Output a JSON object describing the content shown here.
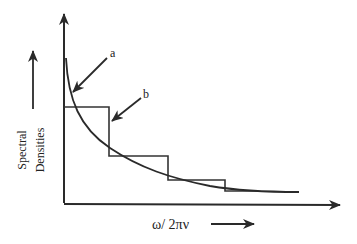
{
  "diagram": {
    "type": "spectral-density-step-approximation",
    "y_axis_label_line1": "Spectral",
    "y_axis_label_line2": "Densities",
    "x_axis_label": "ω/ 2πν",
    "callouts": [
      {
        "label": "a",
        "target": "continuous-curve"
      },
      {
        "label": "b",
        "target": "step-function"
      }
    ],
    "line_color": "#2a2a2a"
  }
}
